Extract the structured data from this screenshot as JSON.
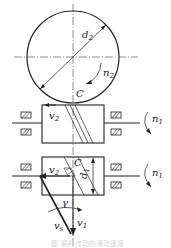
{
  "diagram": {
    "type": "worm-gear-transmission",
    "labels": {
      "d2": "d",
      "d2_sub": "2",
      "n2": "n",
      "n2_sub": "2",
      "C_top": "C",
      "v2_top": "v",
      "v2_top_sub": "2",
      "n1_top": "n",
      "n1_top_sub": "1",
      "C_bottom": "C",
      "d1": "d",
      "d1_sub": "1",
      "v2_bottom": "v",
      "v2_bottom_sub": "2",
      "n1_bottom": "n",
      "n1_bottom_sub": "1",
      "gamma": "γ",
      "vs": "v",
      "vs_sub": "s",
      "v1": "v",
      "v1_sub": "1"
    },
    "caption": "图  蜗杆传动的滑动速度"
  },
  "colors": {
    "line": "#222222",
    "background": "#ffffff"
  }
}
